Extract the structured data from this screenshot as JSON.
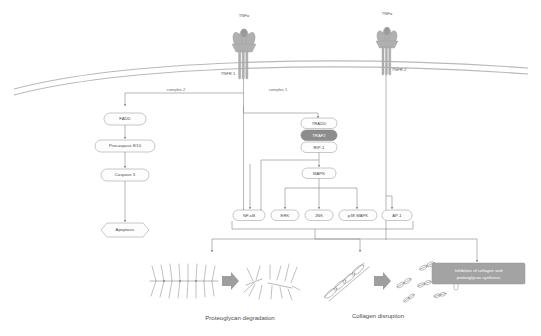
{
  "diagram": {
    "ligands": [
      {
        "id": "tnfa-left",
        "label": "TNFα"
      },
      {
        "id": "tnfa-right",
        "label": "TNFα"
      }
    ],
    "receptors": [
      {
        "id": "tnfr1",
        "label": "TNFR 1"
      },
      {
        "id": "tnfr2",
        "label": "TNFR 2"
      }
    ],
    "edge_labels": [
      {
        "id": "complex-2",
        "label": "complex 2"
      },
      {
        "id": "complex-1",
        "label": "complex 1"
      }
    ],
    "nodes": [
      {
        "id": "fadd",
        "label": "FADD",
        "shape": "rounded",
        "fill": "white"
      },
      {
        "id": "procaspase",
        "label": "Procaspase 8/10",
        "shape": "rounded",
        "fill": "white"
      },
      {
        "id": "caspase3",
        "label": "Caspase 3",
        "shape": "rounded",
        "fill": "white"
      },
      {
        "id": "apoptosis",
        "label": "Apoptosis",
        "shape": "hexagon",
        "fill": "white"
      },
      {
        "id": "tradd",
        "label": "TRADD",
        "shape": "rounded",
        "fill": "white"
      },
      {
        "id": "traf2",
        "label": "TRAF2",
        "shape": "rounded",
        "fill": "grey"
      },
      {
        "id": "rip1",
        "label": "RIP-1",
        "shape": "rounded",
        "fill": "white"
      },
      {
        "id": "mapk",
        "label": "MAPK",
        "shape": "rounded",
        "fill": "white"
      },
      {
        "id": "nfkb",
        "label": "NF-κB",
        "shape": "rounded",
        "fill": "white"
      },
      {
        "id": "erk",
        "label": "ERK",
        "shape": "rounded",
        "fill": "white"
      },
      {
        "id": "jnk",
        "label": "JNK",
        "shape": "rounded",
        "fill": "white"
      },
      {
        "id": "p38mapk",
        "label": "p38 MAPK",
        "shape": "rounded",
        "fill": "white"
      },
      {
        "id": "ap1",
        "label": "AP-1",
        "shape": "rounded",
        "fill": "white"
      },
      {
        "id": "inhibition",
        "label": "Inhibition of collagen and proteoglycan synthesis",
        "shape": "rect",
        "fill": "grey"
      }
    ],
    "captions": [
      {
        "id": "proteoglycan-degradation",
        "label": "Proteoglycan degradation"
      },
      {
        "id": "collagen-disruption",
        "label": "Collagen disruption"
      }
    ],
    "colors": {
      "node_stroke": "#9a9a9a",
      "node_fill": "#fdfdfd",
      "accent_grey": "#8d8d8d",
      "box_grey": "#a3a3a3",
      "membrane": "#b9b9b9",
      "connector": "#8a8a8a",
      "text": "#4a4a4a"
    }
  }
}
